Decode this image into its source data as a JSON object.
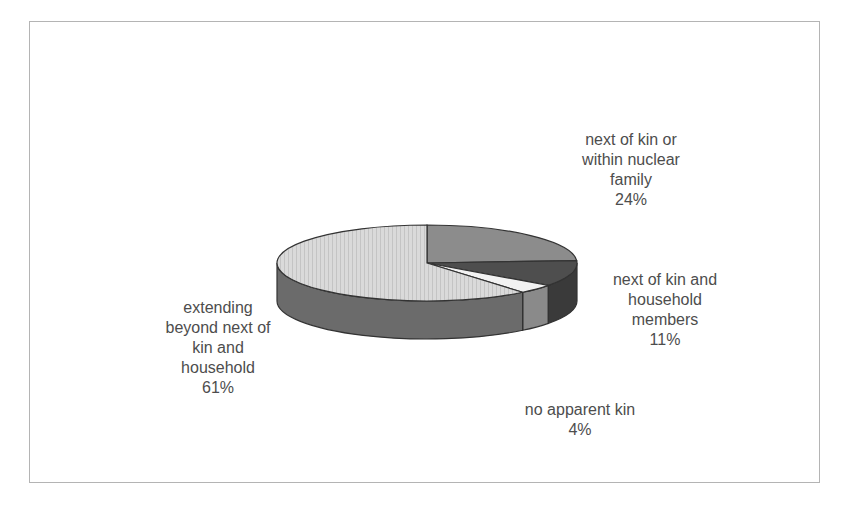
{
  "chart_data": {
    "type": "pie",
    "style": "3d-exploded-none",
    "title": "",
    "categories": [
      "next of kin or within nuclear family",
      "next of kin and household members",
      "no apparent kin",
      "extending beyond next of kin and household"
    ],
    "values": [
      24,
      11,
      4,
      61
    ],
    "unit": "%",
    "labels": [
      {
        "name": "next of kin or\nwithin nuclear\nfamily",
        "pct": "24%"
      },
      {
        "name": "next of kin and\nhousehold\nmembers",
        "pct": "11%"
      },
      {
        "name": "no apparent kin",
        "pct": "4%"
      },
      {
        "name": "extending\nbeyond next of\nkin and\nhousehold",
        "pct": "61%"
      }
    ],
    "colors": [
      "#8c8c8c",
      "#4e4e4e",
      "#f2f2f2",
      "#d9d9d9"
    ],
    "legend": "none (data labels)"
  }
}
